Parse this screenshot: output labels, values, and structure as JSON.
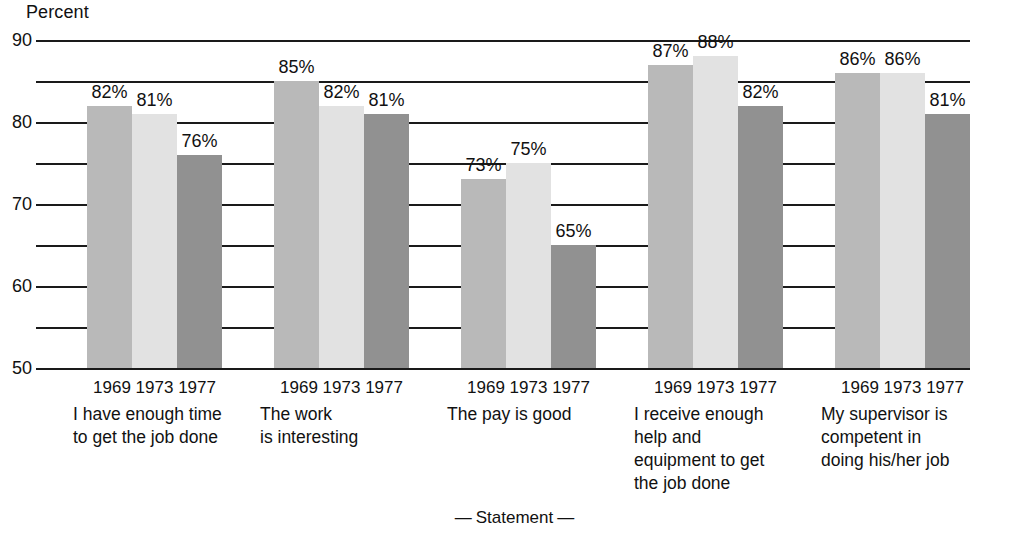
{
  "chart_data": {
    "type": "bar",
    "title": "",
    "ylabel": "Percent",
    "xlabel": "— Statement —",
    "ylim": [
      50,
      90
    ],
    "ytick_labels": [
      "90",
      "80",
      "70",
      "60",
      "50"
    ],
    "ytick_values": [
      90,
      80,
      70,
      60,
      50
    ],
    "minor_tick_values": [
      85,
      75,
      65,
      55
    ],
    "grid": true,
    "legend_position": "none",
    "categories": [
      "I have enough time to get the job done",
      "The work is interesting",
      "The pay is good",
      "I receive enough help and equipment to get the job done",
      "My supervisor is competent in doing his/her job"
    ],
    "series": [
      {
        "name": "1969",
        "values": [
          82,
          85,
          73,
          87,
          86
        ]
      },
      {
        "name": "1973",
        "values": [
          81,
          82,
          75,
          88,
          86
        ]
      },
      {
        "name": "1977",
        "values": [
          76,
          81,
          65,
          82,
          81
        ]
      }
    ],
    "value_labels": [
      [
        "82%",
        "81%",
        "76%"
      ],
      [
        "85%",
        "82%",
        "81%"
      ],
      [
        "73%",
        "75%",
        "65%"
      ],
      [
        "87%",
        "88%",
        "82%"
      ],
      [
        "86%",
        "86%",
        "81%"
      ]
    ],
    "series_colors": [
      "#b9b9b9",
      "#e2e2e2",
      "#919191"
    ],
    "axis_color": "#1a1a1a"
  },
  "axis": {
    "y_title": "Percent",
    "x_title_left_dash": "—",
    "x_title_text": "Statement",
    "x_title_right_dash": "—"
  },
  "groups": [
    {
      "years": "1969 1973 1977",
      "label_lines": [
        "I have enough time",
        "to get the job done"
      ]
    },
    {
      "years": "1969 1973 1977",
      "label_lines": [
        "The work",
        "is interesting"
      ]
    },
    {
      "years": "1969 1973 1977",
      "label_lines": [
        "The pay is good"
      ]
    },
    {
      "years": "1969 1973 1977",
      "label_lines": [
        "I receive enough",
        "help and",
        "equipment to get",
        "the job done"
      ]
    },
    {
      "years": "1969 1973 1977",
      "label_lines": [
        "My supervisor is",
        "competent in",
        "doing his/her job"
      ]
    }
  ]
}
